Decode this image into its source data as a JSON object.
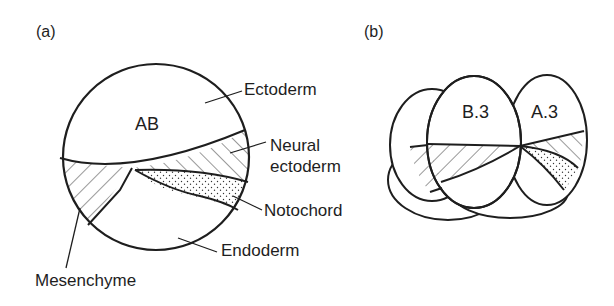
{
  "figure": {
    "panel_a": {
      "label": "(a)",
      "cell_label": "AB",
      "regions": {
        "ectoderm": "Ectoderm",
        "neural_ectoderm_line1": "Neural",
        "neural_ectoderm_line2": "ectoderm",
        "notochord": "Notochord",
        "endoderm": "Endoderm",
        "mesenchyme": "Mesenchyme"
      }
    },
    "panel_b": {
      "label": "(b)",
      "cells": [
        "B.3",
        "A.3"
      ]
    }
  },
  "colors": {
    "line": "#1e1e1e",
    "background": "#ffffff"
  }
}
